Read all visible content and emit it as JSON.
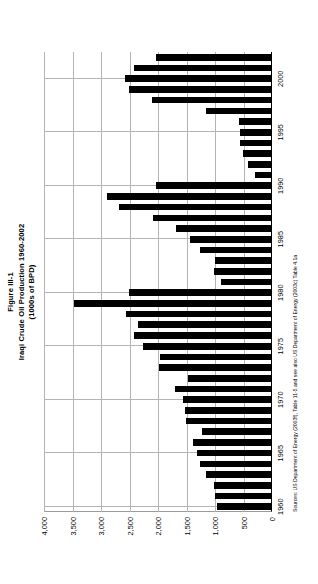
{
  "figure": {
    "number_label": "Figure III-1",
    "title": "Iraqi Crude Oil Production 1960-2002",
    "subtitle": "(1000s of BPD)",
    "source_note": "Sources: US Department of Energy (2003f), Table 11-5 and see also US Department of Energy (2003c) Table 4.1a",
    "orientation_degrees": "-90"
  },
  "chart_data": {
    "type": "bar",
    "title": "Iraqi Crude Oil Production 1960-2002",
    "subtitle": "(1000s of BPD)",
    "xlabel": "",
    "ylabel": "",
    "ylim": [
      0,
      4000
    ],
    "ytick_values": [
      0,
      500,
      1000,
      1500,
      2000,
      2500,
      3000,
      3500,
      4000
    ],
    "ytick_labels": [
      "0",
      "500",
      "1,000",
      "1,500",
      "2,000",
      "2,500",
      "3,000",
      "3,500",
      "4,000"
    ],
    "xtick_labels": [
      "1960",
      "1965",
      "1970",
      "1975",
      "1980",
      "1985",
      "1990",
      "1995",
      "2000"
    ],
    "grid": "horizontal-only",
    "legend": "none",
    "bar_color": "#000000",
    "categories": [
      "1960",
      "1961",
      "1962",
      "1963",
      "1964",
      "1965",
      "1966",
      "1967",
      "1968",
      "1969",
      "1970",
      "1971",
      "1972",
      "1973",
      "1974",
      "1975",
      "1976",
      "1977",
      "1978",
      "1979",
      "1980",
      "1981",
      "1982",
      "1983",
      "1984",
      "1985",
      "1986",
      "1987",
      "1988",
      "1989",
      "1990",
      "1991",
      "1992",
      "1993",
      "1994",
      "1995",
      "1996",
      "1997",
      "1998",
      "1999",
      "2000",
      "2001",
      "2002"
    ],
    "values": [
      972,
      1007,
      1010,
      1162,
      1255,
      1313,
      1392,
      1228,
      1504,
      1521,
      1566,
      1694,
      1466,
      1978,
      1972,
      2262,
      2415,
      2348,
      2563,
      3477,
      2514,
      897,
      1012,
      1005,
      1257,
      1433,
      1690,
      2079,
      2685,
      2897,
      2040,
      305,
      425,
      512,
      553,
      560,
      579,
      1155,
      2110,
      2508,
      2571,
      2414,
      2030
    ]
  }
}
